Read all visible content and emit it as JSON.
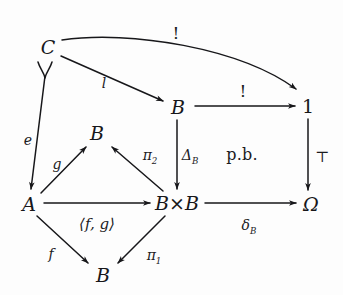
{
  "diagram": {
    "kind": "commutative-diagram",
    "background_color": "#fdfdfd",
    "ink_color": "#17171a",
    "nodes": [
      {
        "id": "C",
        "label": "C",
        "x": 48,
        "y": 47,
        "style": "italic"
      },
      {
        "id": "B_top",
        "label": "B",
        "x": 178,
        "y": 107,
        "style": "italic"
      },
      {
        "id": "one",
        "label": "1",
        "x": 308,
        "y": 106,
        "style": "upright"
      },
      {
        "id": "B_mid",
        "label": "B",
        "x": 97,
        "y": 133,
        "style": "italic"
      },
      {
        "id": "A",
        "label": "A",
        "x": 29,
        "y": 204,
        "style": "italic"
      },
      {
        "id": "BxB",
        "label": "B×B",
        "x": 177,
        "y": 203,
        "style": "italic"
      },
      {
        "id": "Omega",
        "label": "Ω",
        "x": 311,
        "y": 204,
        "style": "italic"
      },
      {
        "id": "B_bot",
        "label": "B",
        "x": 103,
        "y": 275,
        "style": "italic"
      }
    ],
    "edges": [
      {
        "id": "C-to-1",
        "from": "C",
        "to": "one",
        "label": "!",
        "label_kind": "bang",
        "label_x": 176,
        "label_y": 33,
        "shape": "curved"
      },
      {
        "id": "C-to-B",
        "from": "C",
        "to": "B_top",
        "label": "l",
        "label_kind": "italic",
        "label_x": 104,
        "label_y": 83,
        "shape": "straight"
      },
      {
        "id": "C-to-A",
        "from": "C",
        "to": "A",
        "label": "e",
        "label_kind": "italic",
        "label_x": 28,
        "label_y": 140,
        "shape": "hooked"
      },
      {
        "id": "B-to-1",
        "from": "B_top",
        "to": "one",
        "label": "!",
        "label_kind": "bang",
        "label_x": 243,
        "label_y": 91,
        "shape": "straight"
      },
      {
        "id": "B-to-BxB",
        "from": "B_top",
        "to": "BxB",
        "label": "Δ",
        "label_sub": "B",
        "label_kind": "sub",
        "label_x": 190,
        "label_y": 157,
        "shape": "straight"
      },
      {
        "id": "one-to-Om",
        "from": "one",
        "to": "Omega",
        "label": "⊤",
        "label_kind": "top-sym",
        "label_x": 322,
        "label_y": 157,
        "shape": "straight"
      },
      {
        "id": "A-to-Bmid",
        "from": "A",
        "to": "B_mid",
        "label": "g",
        "label_kind": "italic",
        "label_x": 57,
        "label_y": 164,
        "shape": "straight"
      },
      {
        "id": "BxB-to-Bmid",
        "from": "BxB",
        "to": "B_mid",
        "label": "π",
        "label_sub": "2",
        "label_kind": "sub",
        "label_x": 150,
        "label_y": 157,
        "shape": "straight"
      },
      {
        "id": "A-to-BxB",
        "from": "A",
        "to": "BxB",
        "label": "⟨f, g⟩",
        "label_kind": "pair",
        "label_x": 97,
        "label_y": 224,
        "shape": "straight"
      },
      {
        "id": "BxB-to-Om",
        "from": "BxB",
        "to": "Omega",
        "label": "δ",
        "label_sub": "B",
        "label_kind": "sub",
        "label_x": 249,
        "label_y": 227,
        "shape": "straight"
      },
      {
        "id": "A-to-Bbot",
        "from": "A",
        "to": "B_bot",
        "label": "f",
        "label_kind": "italic",
        "label_x": 51,
        "label_y": 254,
        "shape": "straight"
      },
      {
        "id": "BxB-to-Bbot",
        "from": "BxB",
        "to": "B_bot",
        "label": "π",
        "label_sub": "1",
        "label_kind": "sub",
        "label_x": 154,
        "label_y": 257,
        "shape": "straight"
      }
    ],
    "annotations": [
      {
        "id": "pullback-marker",
        "label": "p.b.",
        "x": 242,
        "y": 155
      }
    ]
  }
}
